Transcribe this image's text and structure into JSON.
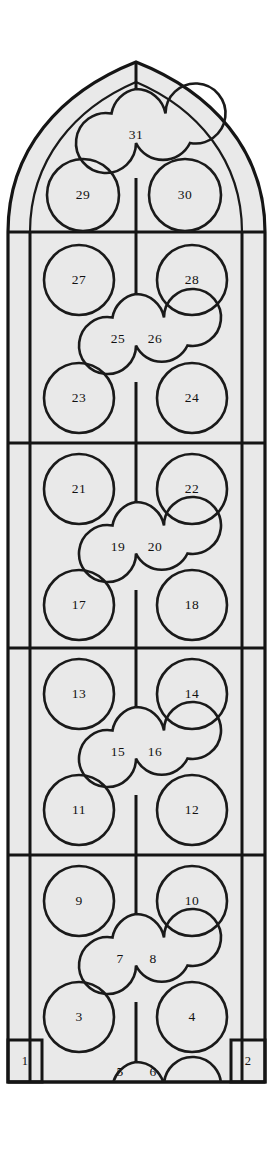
{
  "figure": {
    "kind": "gothic-window-panel-diagram",
    "title": "",
    "total_lights": 31,
    "colors": {
      "glass_fill": "#e9e9e9",
      "tracery_stroke": "#151515",
      "background": "#ffffff",
      "numeral_color": "#111111"
    }
  },
  "geometry": {
    "panel_left": 8,
    "panel_right": 265,
    "panel_bottom": 1082,
    "apex_y": 62,
    "mullion_left_x": 30,
    "mullion_center_x": 136,
    "mullion_right_x": 242,
    "transoms_y": [
      232,
      443,
      648,
      855
    ],
    "spring_y": 232
  },
  "tiers": [
    {
      "name": "head-tracery",
      "quatrefoil": {
        "label": "31",
        "cx": 136,
        "cy": 135,
        "r": 46
      },
      "circles": [
        {
          "label": "29",
          "cx": 83,
          "cy": 195,
          "r": 36
        },
        {
          "label": "30",
          "cx": 185,
          "cy": 195,
          "r": 36
        }
      ]
    },
    {
      "name": "tier-5",
      "quatrefoil": {
        "labels": [
          "25",
          "26"
        ],
        "cx": 136,
        "cy": 338,
        "r": 44
      },
      "circles": [
        {
          "label": "27",
          "cx": 79,
          "cy": 280,
          "r": 35
        },
        {
          "label": "28",
          "cx": 192,
          "cy": 280,
          "r": 35
        },
        {
          "label": "23",
          "cx": 79,
          "cy": 398,
          "r": 35
        },
        {
          "label": "24",
          "cx": 192,
          "cy": 398,
          "r": 35
        }
      ]
    },
    {
      "name": "tier-4",
      "quatrefoil": {
        "labels": [
          "19",
          "20"
        ],
        "cx": 136,
        "cy": 546,
        "r": 44
      },
      "circles": [
        {
          "label": "21",
          "cx": 79,
          "cy": 489,
          "r": 35
        },
        {
          "label": "22",
          "cx": 192,
          "cy": 489,
          "r": 35
        },
        {
          "label": "17",
          "cx": 79,
          "cy": 605,
          "r": 35
        },
        {
          "label": "18",
          "cx": 192,
          "cy": 605,
          "r": 35
        }
      ]
    },
    {
      "name": "tier-3",
      "quatrefoil": {
        "labels": [
          "15",
          "16"
        ],
        "cx": 136,
        "cy": 751,
        "r": 44
      },
      "circles": [
        {
          "label": "13",
          "cx": 79,
          "cy": 694,
          "r": 35
        },
        {
          "label": "14",
          "cx": 192,
          "cy": 694,
          "r": 35
        },
        {
          "label": "11",
          "cx": 79,
          "cy": 810,
          "r": 35
        },
        {
          "label": "12",
          "cx": 192,
          "cy": 810,
          "r": 35
        }
      ]
    },
    {
      "name": "tier-2",
      "quatrefoil": {
        "labels": [
          "7",
          "8"
        ],
        "cx": 136,
        "cy": 958,
        "r": 44
      },
      "circles": [
        {
          "label": "9",
          "cx": 79,
          "cy": 901,
          "r": 35
        },
        {
          "label": "10",
          "cx": 192,
          "cy": 901,
          "r": 35
        },
        {
          "label": "3",
          "cx": 79,
          "cy": 1017,
          "r": 35
        },
        {
          "label": "4",
          "cx": 192,
          "cy": 1017,
          "r": 35
        }
      ]
    },
    {
      "name": "tier-1-base",
      "quatrefoil": {
        "labels": [
          "5",
          "6"
        ],
        "cx": 136,
        "cy": 1105,
        "r": 44,
        "clipped": true
      },
      "circles": []
    }
  ],
  "base_panels": [
    {
      "label": "1",
      "x": 8,
      "y": 1040,
      "width": 34,
      "height": 42,
      "side": "left"
    },
    {
      "label": "2",
      "x": 231,
      "y": 1040,
      "width": 34,
      "height": 42,
      "side": "right"
    }
  ],
  "light_numbers": [
    "1",
    "2",
    "3",
    "4",
    "5",
    "6",
    "7",
    "8",
    "9",
    "10",
    "11",
    "12",
    "13",
    "14",
    "15",
    "16",
    "17",
    "18",
    "19",
    "20",
    "21",
    "22",
    "23",
    "24",
    "25",
    "26",
    "27",
    "28",
    "29",
    "30",
    "31"
  ]
}
